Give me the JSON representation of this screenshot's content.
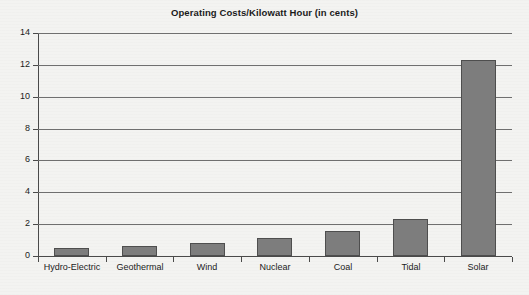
{
  "chart_data": {
    "type": "bar",
    "title": "Operating Costs/Kilowatt Hour (in cents)",
    "xlabel": "",
    "ylabel": "",
    "categories": [
      "Hydro-Electric",
      "Geothermal",
      "Wind",
      "Nuclear",
      "Coal",
      "Tidal",
      "Solar"
    ],
    "values": [
      0.5,
      0.65,
      0.8,
      1.1,
      1.55,
      2.3,
      12.3
    ],
    "ylim": [
      0,
      14
    ],
    "yticks": [
      0,
      2,
      4,
      6,
      8,
      10,
      12,
      14
    ],
    "ytick_labels": [
      "0",
      "2",
      "4",
      "6",
      "8",
      "10",
      "12",
      "14"
    ],
    "grid": true,
    "grid_axis": "y",
    "legend": false,
    "bar_color": "#7d7d7d",
    "bar_edge_color": "#4e4e4e",
    "background_color": "#f3f3f1",
    "axis_color": "#4a4a4a",
    "text_color": "#1b1b1b"
  }
}
